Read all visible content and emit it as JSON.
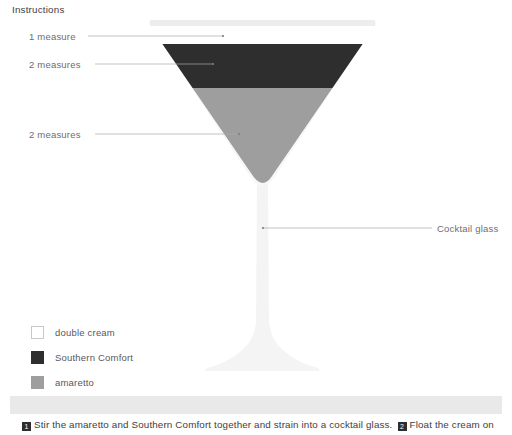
{
  "diagram": {
    "title_alt": "Cocktail layer diagram",
    "callouts": [
      {
        "id": "cream-measure",
        "text": "1 measure"
      },
      {
        "id": "southern-comfort-measure",
        "text": "2 measures"
      },
      {
        "id": "amaretto-measure",
        "text": "2 measures"
      },
      {
        "id": "glassware",
        "text": "Cocktail glass"
      }
    ],
    "colors": {
      "double_cream": "#ffffff",
      "southern_comfort": "#2e2e2e",
      "amaretto": "#9e9e9e",
      "glass": "#f2f2f3",
      "rim": "#ededee",
      "leader_line": "#a7a9ac",
      "label_text": "#6d6e71"
    }
  },
  "legend": {
    "items": [
      {
        "label": "double cream",
        "swatch": "#ffffff"
      },
      {
        "label": "Southern Comfort",
        "swatch": "#2e2e2e"
      },
      {
        "label": "amaretto",
        "swatch": "#9e9e9e"
      }
    ]
  },
  "instructions": {
    "header": "Instructions",
    "steps": [
      {
        "number": "1",
        "text": "Stir the amaretto and Southern Comfort together and strain into a cocktail glass."
      },
      {
        "number": "2",
        "text": "Float the cream on"
      }
    ]
  }
}
